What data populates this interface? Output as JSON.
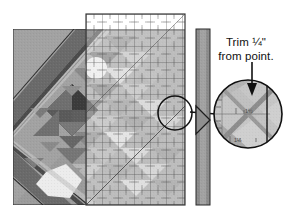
{
  "figure": {
    "kind": "quilting-instruction-diagram",
    "caption_lines": [
      "Trim ¼\"",
      "from point."
    ],
    "trim_amount": "¼\"",
    "colors": {
      "background": "#ffffff",
      "quilt_medium_gray": "#9b9b9b",
      "quilt_dark_gray": "#6d6d6d",
      "quilt_darker_gray": "#565656",
      "quilt_light_gray": "#c3c3c3",
      "quilt_lightest": "#e8e8e8",
      "ruler_tint": "#d8d8d8",
      "ruler_line": "#4a4a4a",
      "strip_fill": "#a0a0a0",
      "outline": "#1a1a1a",
      "text": "#111111"
    }
  },
  "annotation": {
    "line1": "Trim ¼\"",
    "line2": "from point.",
    "arrow": "down-arrow-icon"
  },
  "magnifier": {
    "label": "detail-circle",
    "center_x": 248,
    "center_y": 114,
    "radius": 34,
    "ruler_marks": [
      "1½",
      "1¼"
    ]
  },
  "callout": {
    "source_circle": {
      "center_x": 175,
      "center_y": 113,
      "radius": 17
    },
    "leader_line": {
      "x1": 190,
      "y1": 112,
      "x2": 215,
      "y2": 114
    }
  },
  "quilt_block": {
    "name": "pieced-quilt-block-with-diagonal-sashing",
    "x": 13,
    "y": 29,
    "width": 172,
    "height": 176
  },
  "acrylic_ruler": {
    "name": "transparent-quilting-ruler-overlay",
    "x": 86,
    "y": 14,
    "width": 99,
    "height": 191,
    "grid_spacing_px": 16
  },
  "fabric_strip": {
    "name": "vertical-fabric-strip",
    "x": 196,
    "y": 29,
    "width": 14,
    "height": 176
  }
}
